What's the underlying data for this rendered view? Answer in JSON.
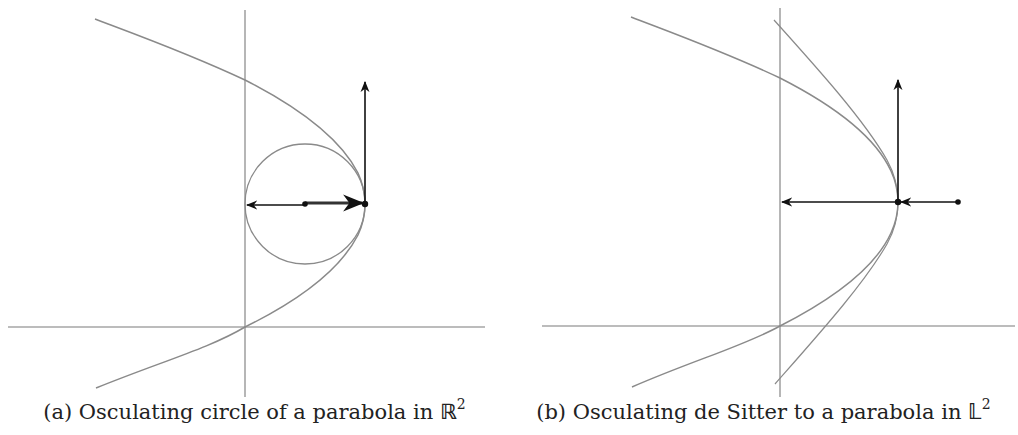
{
  "figure": {
    "panels": [
      {
        "id": "a",
        "caption_prefix": "(a) Osculating circle of a parabola in ",
        "caption_space": "ℝ",
        "caption_exp": "2",
        "elements": [
          "axes",
          "parabola",
          "osculating circle",
          "normal vector (left arrow)",
          "tangent vector (up arrow)",
          "center point",
          "vertex point"
        ]
      },
      {
        "id": "b",
        "caption_prefix": "(b) Osculating de Sitter to a parabola in ",
        "caption_space": "𝕃",
        "caption_exp": "2",
        "elements": [
          "axes",
          "parabola",
          "osculating de Sitter (hyperbola)",
          "normal vector (left arrow)",
          "tangent vector (up arrow)",
          "center point",
          "vertex point"
        ]
      }
    ],
    "colors": {
      "curve": "#8a8a8a",
      "axis": "#7a7a7a",
      "vector": "#111111"
    }
  }
}
